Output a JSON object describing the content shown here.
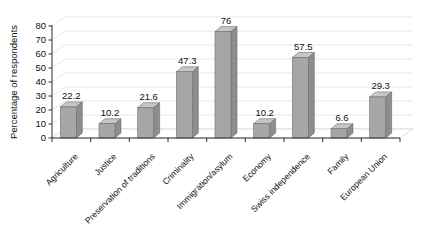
{
  "chart_data": {
    "type": "bar",
    "title": "",
    "subtitle": "",
    "xlabel": "",
    "ylabel": "Percentage of respondents",
    "ylim": [
      0,
      80
    ],
    "yticks": [
      0,
      10,
      20,
      30,
      40,
      50,
      60,
      70,
      80
    ],
    "grid": true,
    "legend": "none",
    "three_d": true,
    "categories": [
      "Agriculture",
      "Justice",
      "Preservation of traditions",
      "Criminality",
      "Immigration/asylum",
      "Economy",
      "Swiss independence",
      "Family",
      "European Union"
    ],
    "values": [
      22.2,
      10.2,
      21.6,
      47.3,
      76,
      10.2,
      57.5,
      6.6,
      29.3
    ],
    "value_labels": [
      "22.2",
      "10.2",
      "21.6",
      "47.3",
      "76",
      "10.2",
      "57.5",
      "6.6",
      "29.3"
    ],
    "colors": {
      "bar_front": "#a6a6a6",
      "bar_side": "#8d8d8d",
      "bar_top": "#c6c6c6",
      "bar_stroke": "#6e6e6e",
      "gridline": "#dcdcdc",
      "axis": "#2f2f2f",
      "floor": "#ffffff",
      "text": "#111111",
      "background": "#ffffff"
    }
  }
}
